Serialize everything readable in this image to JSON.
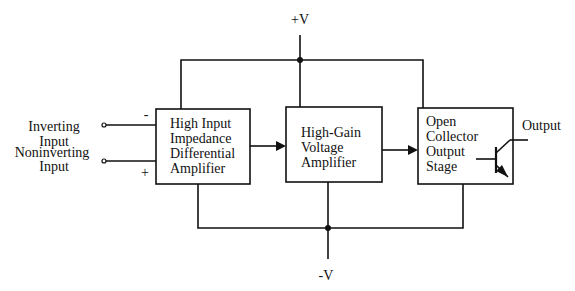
{
  "diagram": {
    "supply_positive": "+V",
    "supply_negative": "-V",
    "inputs": {
      "inverting_line1": "Inverting",
      "inverting_line2": "Input",
      "noninverting_line1": "Noninverting",
      "noninverting_line2": "Input",
      "minus_sign": "-",
      "plus_sign": "+"
    },
    "blocks": [
      {
        "lines": [
          "High Input",
          "Impedance",
          "Differential",
          "Amplifier"
        ]
      },
      {
        "lines": [
          "High-Gain",
          "Voltage",
          "Amplifier"
        ]
      },
      {
        "lines": [
          "Open",
          "Collector",
          "Output",
          "Stage"
        ]
      }
    ],
    "output_label": "Output",
    "line_color": "#111111"
  }
}
